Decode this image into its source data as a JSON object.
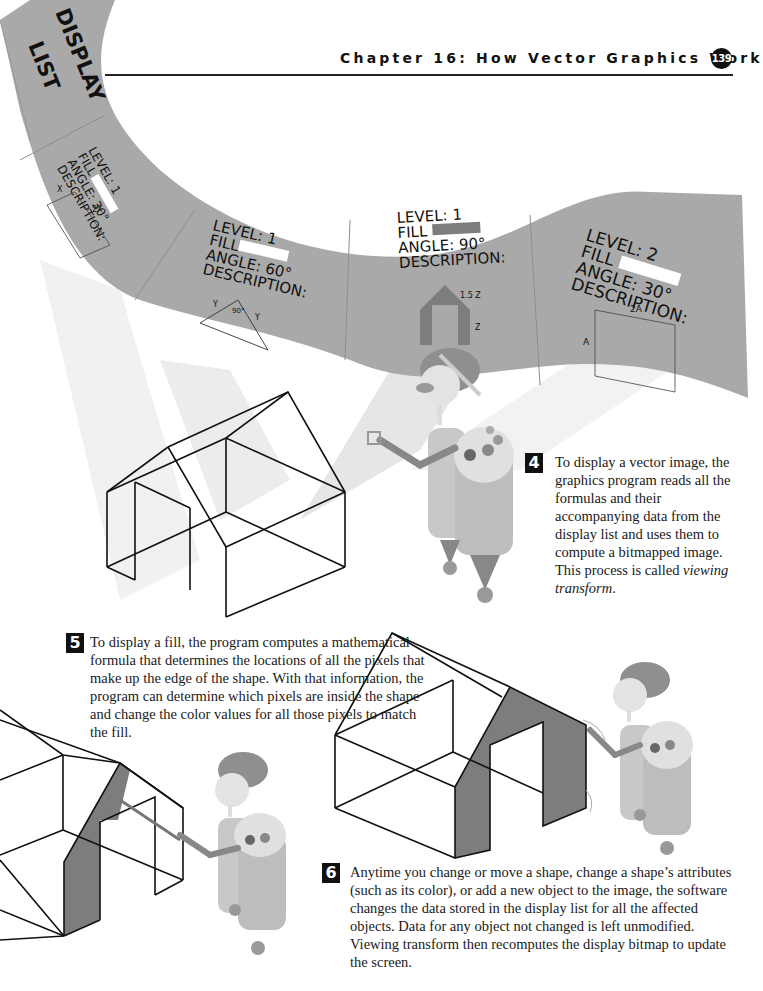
{
  "header": {
    "chapter_title": "Chapter 16: How Vector Graphics Work",
    "page_number": "139"
  },
  "display_list": {
    "banner_label_line1": "DISPLAY",
    "banner_label_line2": "LIST",
    "entries": [
      {
        "level": "LEVEL: 1",
        "fill_label": "FILL",
        "fill_color": "#ffffff",
        "angle": "ANGLE: 30°",
        "description": "DESCRIPTION:",
        "shape": "rectangle",
        "dims": [
          "X",
          "2X"
        ]
      },
      {
        "level": "LEVEL: 1",
        "fill_label": "FILL",
        "fill_color": "#ffffff",
        "angle": "ANGLE: 60°",
        "description": "DESCRIPTION:",
        "shape": "triangle",
        "dims": [
          "Y",
          "Y",
          "90°"
        ]
      },
      {
        "level": "LEVEL: 1",
        "fill_label": "FILL",
        "fill_color": "#8a8a8a",
        "angle": "ANGLE: 90°",
        "description": "DESCRIPTION:",
        "shape": "house-outline",
        "dims": [
          "1.5 Z",
          "Z"
        ]
      },
      {
        "level": "LEVEL: 2",
        "fill_label": "FILL",
        "fill_color": "#ffffff",
        "angle": "ANGLE: 30°",
        "description": "DESCRIPTION:",
        "shape": "rectangle",
        "dims": [
          "2A",
          "A"
        ]
      }
    ]
  },
  "steps": [
    {
      "number": "4",
      "text": "To display a vector image, the graphics program reads all the formulas and their accompanying data from the display list and uses them to compute a bitmapped image. This process is called ",
      "italic": "viewing transform",
      "suffix": "."
    },
    {
      "number": "5",
      "text": "To display a fill, the program computes a mathematical formula that determines the locations of all the pixels that make up the edge of the shape. With that information, the program can determine which pixels are inside the shape and change the color values for all those pixels to match the fill."
    },
    {
      "number": "6",
      "text": "Anytime you change or move a shape, change a shape’s attributes (such as its color), or add a new object to the image, the software changes the data stored in the display list for all the affected objects. Data for any object not changed is left unmodified. Viewing transform then recomputes the display bitmap to update the screen."
    }
  ],
  "colors": {
    "banner_gray": "#a9a9a9",
    "fill_gray": "#7d7d7d",
    "robot_gray": "#b8b8b8"
  }
}
